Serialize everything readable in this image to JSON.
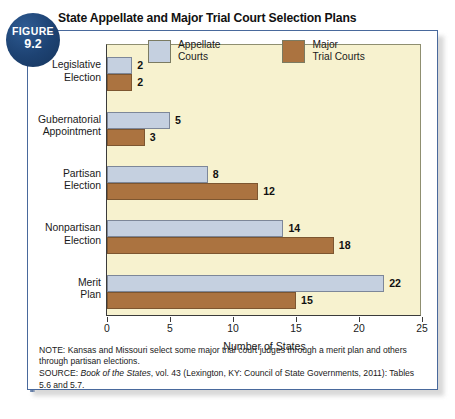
{
  "figure": {
    "badge_word": "FIGURE",
    "badge_number": "9.2",
    "title": "State Appellate and Major Trial Court Selection Plans"
  },
  "legend": {
    "items": [
      {
        "label": "Appellate\nCourts",
        "color": "#c5d0e0",
        "name": "appellate-courts"
      },
      {
        "label": "Major\nTrial Courts",
        "color": "#ab7340",
        "name": "major-trial-courts"
      }
    ]
  },
  "footnotes": {
    "note_prefix": "NOTE:",
    "note": "NOTE: Kansas and Missouri select some major trial court judges through a merit plan and others through partisan elections.",
    "source_prefix": "SOURCE:",
    "source_italic": "Book of the States",
    "source_rest": ", vol. 43 (Lexington, KY: Council of State Governments, 2011): Tables 5.6 and 5.7."
  },
  "chart_data": {
    "type": "bar",
    "orientation": "horizontal",
    "title": "State Appellate and Major Trial Court Selection Plans",
    "xlabel": "Number of States",
    "ylabel": "",
    "xlim": [
      0,
      25
    ],
    "xticks": [
      0,
      5,
      10,
      15,
      20,
      25
    ],
    "xtick_labels": [
      "0",
      "5",
      "10",
      "15",
      "20",
      "25"
    ],
    "grid": false,
    "legend_position": "top-inside",
    "categories": [
      "Legislative\nElection",
      "Gubernatorial\nAppointment",
      "Partisan\nElection",
      "Nonpartisan\nElection",
      "Merit\nPlan"
    ],
    "series": [
      {
        "name": "Appellate Courts",
        "color": "#c5d0e0",
        "values": [
          2,
          5,
          8,
          14,
          22
        ]
      },
      {
        "name": "Major Trial Courts",
        "color": "#ab7340",
        "values": [
          2,
          3,
          12,
          18,
          15
        ]
      }
    ]
  }
}
